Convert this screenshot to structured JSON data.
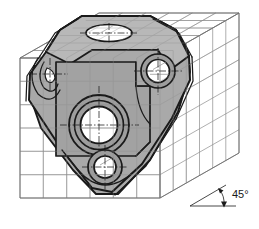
{
  "drawing": {
    "title": "Oblique projection of machined bracket inside reference grid cube",
    "annotations": [
      {
        "id": "receding-axis-angle",
        "label": "45°",
        "x": 232,
        "y": 198
      }
    ],
    "colors": {
      "part_fill": "#a9a9a9",
      "part_fill_light": "#bdbdbd",
      "part_fill_dark": "#949494",
      "hole_fill": "#ffffff",
      "outline": "#1a1a1a",
      "grid_line": "#8c8c8c",
      "cube_edge": "#6e6e6e",
      "centerline": "#1a1a1a",
      "background": "#ffffff"
    },
    "grid_cube": {
      "name": "reference-grid-cube",
      "divisions": 6,
      "faces": [
        "top",
        "front",
        "right"
      ],
      "projection": "oblique",
      "receding_angle_deg": 45
    },
    "part": {
      "name": "machined-bracket",
      "features": [
        {
          "id": "top-face-hole",
          "kind": "elliptical-hole",
          "cx": 109,
          "cy": 33,
          "rx": 23,
          "ry": 8
        },
        {
          "id": "center-hole",
          "kind": "counterbored-hole",
          "cx": 99,
          "cy": 125,
          "r": 21
        },
        {
          "id": "upper-right-hole",
          "kind": "counterbored-hole",
          "cx": 158,
          "cy": 71,
          "r": 13
        },
        {
          "id": "lower-hole",
          "kind": "counterbored-hole",
          "cx": 105,
          "cy": 167,
          "r": 12
        },
        {
          "id": "left-pocket",
          "kind": "partial-pocket",
          "cx": 51,
          "cy": 72,
          "r": 13
        }
      ]
    }
  }
}
